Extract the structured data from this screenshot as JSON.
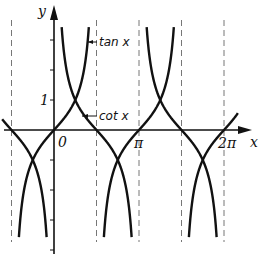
{
  "chart_data": {
    "type": "line",
    "title": "",
    "xlabel": "x",
    "ylabel": "y",
    "x_tick_labels": [
      "0",
      "π",
      "2π"
    ],
    "y_tick_labels": [
      "1"
    ],
    "xlim": [
      -1.57,
      2.4
    ],
    "ylim": [
      -3.7,
      4.2
    ],
    "grid": false,
    "legend": "inline annotations",
    "annotations": [
      "tan x",
      "cot x"
    ],
    "asymptotes_dashed": [
      "-π/2",
      "π/2",
      "π",
      "3π/2",
      "2π"
    ],
    "series": [
      {
        "name": "tan x",
        "function": "tan(x)",
        "branches": [
          "(-π/2, π/2)",
          "(π/2, 3π/2)",
          "(3π/2, 5π/2)"
        ]
      },
      {
        "name": "cot x",
        "function": "cot(x)",
        "branches": [
          "(-π, 0)",
          "(0, π)",
          "(π, 2π)"
        ]
      }
    ]
  },
  "labels": {
    "y_axis": "y",
    "x_axis": "x",
    "origin": "0",
    "pi": "π",
    "two_pi": "2π",
    "one": "1",
    "tan": "tan x",
    "cot": "cot x"
  },
  "colors": {
    "curve": "#111111",
    "axis": "#111111",
    "dashed": "#777777"
  }
}
